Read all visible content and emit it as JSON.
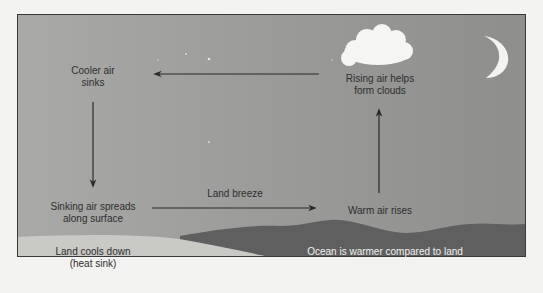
{
  "diagram": {
    "colors": {
      "sky": "#9c9c9a",
      "land": "#c9c9c6",
      "ocean": "#5f5f5f",
      "cloud": "#f5f5f3",
      "moon": "#f3f3f0",
      "arrow": "#2a2a2a",
      "frame_border": "#3a3a3a"
    },
    "nodes": {
      "cooler_air": {
        "line1": "Cooler air",
        "line2": "sinks"
      },
      "rising_air": {
        "line1": "Rising air helps",
        "line2": "form clouds"
      },
      "sinking_air": {
        "line1": "Sinking air spreads",
        "line2": "along surface"
      },
      "warm_air": {
        "line1": "Warm air rises"
      },
      "land": {
        "line1": "Land cools down",
        "line2": "(heat sink)"
      },
      "ocean": {
        "line1": "Ocean is warmer compared to land",
        "line2": "(heat source)"
      }
    },
    "arrows": [
      {
        "id": "top",
        "from": "rising_air",
        "to": "cooler_air",
        "direction": "left"
      },
      {
        "id": "left",
        "from": "cooler_air",
        "to": "sinking_air",
        "direction": "down"
      },
      {
        "id": "bottom",
        "from": "sinking_air",
        "to": "warm_air",
        "direction": "right",
        "label": "Land breeze"
      },
      {
        "id": "right",
        "from": "warm_air",
        "to": "rising_air",
        "direction": "up"
      }
    ],
    "icons": {
      "cloud": "cloud-icon",
      "moon": "crescent-moon-icon",
      "stars": "star-icon"
    }
  }
}
